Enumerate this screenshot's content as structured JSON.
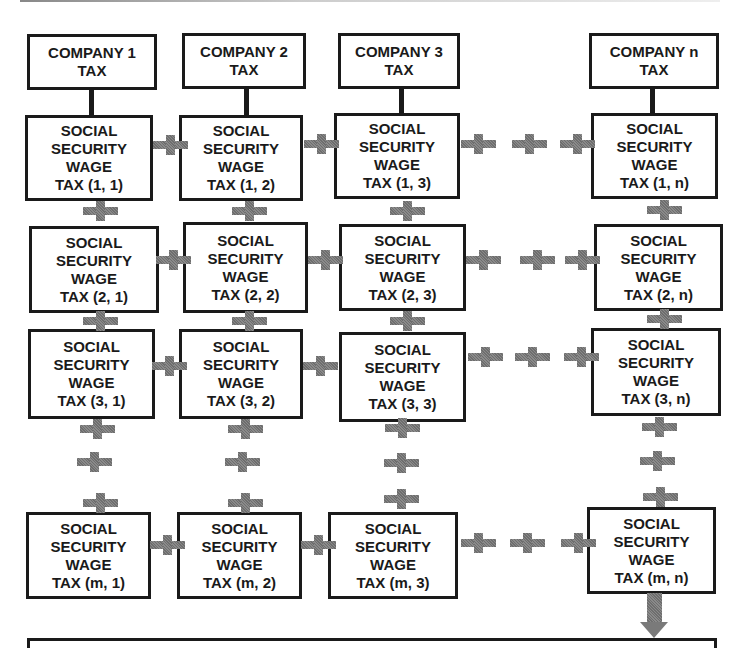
{
  "diagram": {
    "companies": [
      {
        "line1": "COMPANY 1",
        "line2": "TAX"
      },
      {
        "line1": "COMPANY 2",
        "line2": "TAX"
      },
      {
        "line1": "COMPANY 3",
        "line2": "TAX"
      },
      {
        "line1": "COMPANY n",
        "line2": "TAX"
      }
    ],
    "cell_lines": [
      "SOCIAL",
      "SECURITY",
      "WAGE"
    ],
    "cells": [
      [
        "TAX (1, 1)",
        "TAX (1, 2)",
        "TAX (1, 3)",
        "TAX (1, n)"
      ],
      [
        "TAX (2, 1)",
        "TAX (2, 2)",
        "TAX (2, 3)",
        "TAX (2, n)"
      ],
      [
        "TAX (3, 1)",
        "TAX (3, 2)",
        "TAX (3, 3)",
        "TAX (3, n)"
      ],
      [
        "TAX (m, 1)",
        "TAX (m, 2)",
        "TAX (m, 3)",
        "TAX (m, n)"
      ]
    ],
    "connector_symbol": "plus",
    "colors": {
      "border": "#1a1a1a",
      "connector": "#7a7a7a",
      "background": "#ffffff"
    }
  }
}
